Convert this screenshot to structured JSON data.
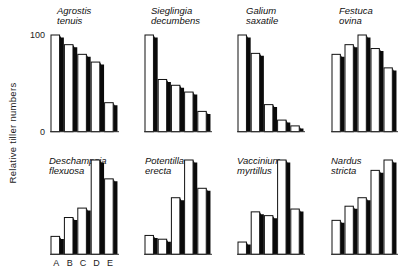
{
  "chart_data": {
    "type": "bar",
    "title": "",
    "ylabel": "Relative tiller numbers",
    "xlabel": "",
    "ylim": [
      0,
      100
    ],
    "yticks": [
      "0",
      "100"
    ],
    "categories": [
      "A",
      "B",
      "C",
      "D",
      "E"
    ],
    "grid": false,
    "legend": "none",
    "layout": "2 rows x 4 columns of small-multiple bar charts",
    "panels": [
      {
        "name": "Agrostis tenuis",
        "title_lines": [
          "Agrostis",
          "tenuis"
        ],
        "values": [
          100,
          90,
          80,
          72,
          30
        ]
      },
      {
        "name": "Sieglingia decumbens",
        "title_lines": [
          "Sieglingia",
          "decumbens"
        ],
        "values": [
          100,
          54,
          48,
          41,
          21
        ]
      },
      {
        "name": "Galium saxatile",
        "title_lines": [
          "Galium",
          "saxatile"
        ],
        "values": [
          100,
          81,
          28,
          12,
          6
        ]
      },
      {
        "name": "Festuca ovina",
        "title_lines": [
          "Festuca",
          "ovina"
        ],
        "values": [
          80,
          90,
          100,
          86,
          66
        ]
      },
      {
        "name": "Deschampsia flexuosa",
        "title_lines": [
          "Deschampsia",
          "flexuosa"
        ],
        "values": [
          19,
          39,
          49,
          100,
          80
        ]
      },
      {
        "name": "Potentilla erecta",
        "title_lines": [
          "Potentilla",
          "erecta"
        ],
        "values": [
          20,
          16,
          60,
          100,
          70
        ]
      },
      {
        "name": "Vaccinium myrtillus",
        "title_lines": [
          "Vaccinium",
          "myrtillus"
        ],
        "values": [
          13,
          45,
          41,
          100,
          48
        ]
      },
      {
        "name": "Nardus stricta",
        "title_lines": [
          "Nardus",
          "stricta"
        ],
        "values": [
          36,
          51,
          60,
          89,
          100
        ]
      }
    ]
  }
}
